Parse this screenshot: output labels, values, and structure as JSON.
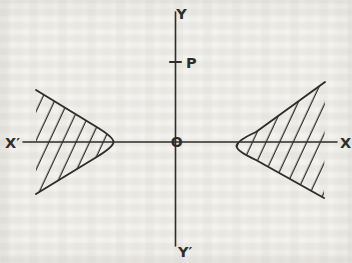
{
  "diagram": {
    "labels": {
      "y_top": "Y",
      "y_bottom": "Y′",
      "x_left": "X′",
      "x_right": "X",
      "point": "P",
      "origin": "O"
    },
    "colors": {
      "ink": "#2e2d2b",
      "paper": "#f4f3ef"
    }
  }
}
